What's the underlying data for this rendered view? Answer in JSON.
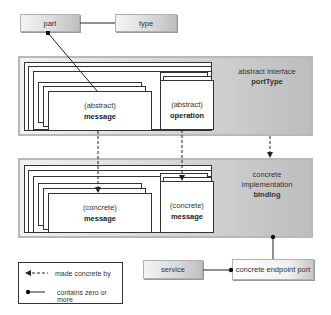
{
  "top_row": {
    "part": "part",
    "type": "type"
  },
  "abstract_panel": {
    "caption_line1": "abstract interface",
    "caption_bold": "portType",
    "message": {
      "qualifier": "(abstract)",
      "name": "message"
    },
    "operation": {
      "qualifier": "(abstract)",
      "name": "operation"
    }
  },
  "concrete_panel": {
    "caption_line1": "concrete",
    "caption_line2": "implementation",
    "caption_bold": "binding",
    "message_left": {
      "qualifier": "(concrete)",
      "name": "message"
    },
    "message_right": {
      "qualifier": "(concrete)",
      "name": "message"
    }
  },
  "bottom_row": {
    "service": "service",
    "endpoint": "concrete endpoint port"
  },
  "legend": {
    "dashed": "made concrete by",
    "solid": "contains zero or more"
  },
  "colors": {
    "line": "#222222",
    "panel_light": "#f2f2f2",
    "panel_dark": "#bdbdbd",
    "border": "#b8b8b8"
  }
}
